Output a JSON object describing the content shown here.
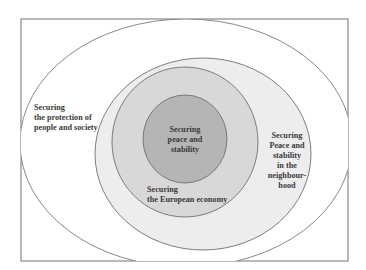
{
  "diagram": {
    "colors": {
      "frame": "#8a8a8a",
      "outer_fill": "#ffffff",
      "neighbourhood_fill": "#ededed",
      "economy_fill": "#d8d8d8",
      "core_fill": "#b5b5b5",
      "stroke": "#6f6f6f",
      "text": "#3a3a3a"
    },
    "layers": [
      {
        "id": "people-society",
        "lines": [
          "Securing",
          "the protection of",
          "people and society"
        ]
      },
      {
        "id": "neighbourhood",
        "lines": [
          "Securing",
          "Peace and",
          "stability",
          "in the",
          "neighbour-",
          "hood"
        ]
      },
      {
        "id": "european-economy",
        "lines": [
          "Securing",
          "the European economy"
        ]
      },
      {
        "id": "core",
        "lines": [
          "Securing",
          "peace and",
          "stability"
        ]
      }
    ]
  }
}
